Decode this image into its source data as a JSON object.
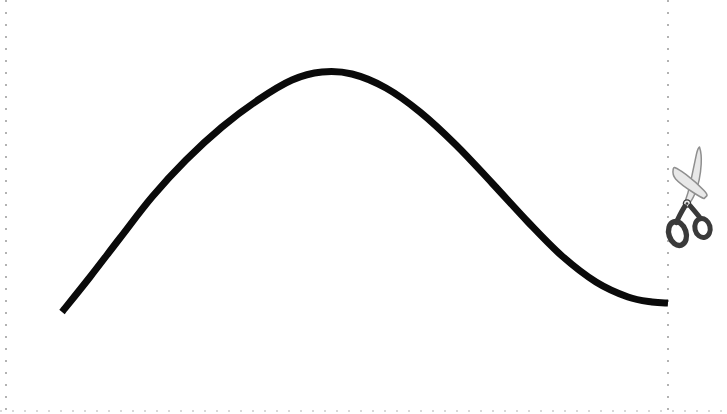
{
  "figure": {
    "title": "Cut-out coupon curve figure",
    "background_color": "#ffffff",
    "width": 727,
    "height": 414
  },
  "cut_border": {
    "name": "dotted-cut-border",
    "description": "Dotted cut-here guide lines along left, right and bottom edges",
    "color": "#b3b3b3",
    "bottom_color": "#d8d8d8",
    "dot_size": 2,
    "dot_gap": 10,
    "edges": [
      "left",
      "right",
      "bottom"
    ],
    "left_x": 6,
    "right_x": 668,
    "bottom_y": 411
  },
  "scissors": {
    "name": "scissors-icon",
    "label": "scissors",
    "description": "Tailor's shears pointing up-left, straddling the right cut line",
    "blade_color": "#8f8f8f",
    "blade_fill": "#e8e8e8",
    "handle_color": "#3a3a3a",
    "position": {
      "x": 668,
      "y": 195
    }
  },
  "chart_data": {
    "type": "line",
    "title": "",
    "subtitle": "",
    "xlabel": "",
    "ylabel": "",
    "grid": false,
    "legend": null,
    "axis_visible": false,
    "tick_labels_x": [],
    "tick_labels_y": [],
    "xlim": [
      0,
      727
    ],
    "ylim": [
      414,
      0
    ],
    "series": [
      {
        "name": "bell-curve",
        "color": "#0a0a0a",
        "line_width": 7,
        "points": [
          {
            "x": 62,
            "y": 312
          },
          {
            "x": 90,
            "y": 277
          },
          {
            "x": 120,
            "y": 238
          },
          {
            "x": 152,
            "y": 197
          },
          {
            "x": 186,
            "y": 160
          },
          {
            "x": 222,
            "y": 127
          },
          {
            "x": 258,
            "y": 100
          },
          {
            "x": 292,
            "y": 80
          },
          {
            "x": 322,
            "y": 72
          },
          {
            "x": 352,
            "y": 74
          },
          {
            "x": 386,
            "y": 88
          },
          {
            "x": 420,
            "y": 112
          },
          {
            "x": 456,
            "y": 145
          },
          {
            "x": 492,
            "y": 183
          },
          {
            "x": 528,
            "y": 222
          },
          {
            "x": 562,
            "y": 256
          },
          {
            "x": 596,
            "y": 282
          },
          {
            "x": 628,
            "y": 297
          },
          {
            "x": 652,
            "y": 302
          },
          {
            "x": 668,
            "y": 303
          }
        ],
        "peak": {
          "x": 322,
          "y": 72
        },
        "start": {
          "x": 62,
          "y": 312
        },
        "end": {
          "x": 668,
          "y": 303
        }
      }
    ]
  }
}
